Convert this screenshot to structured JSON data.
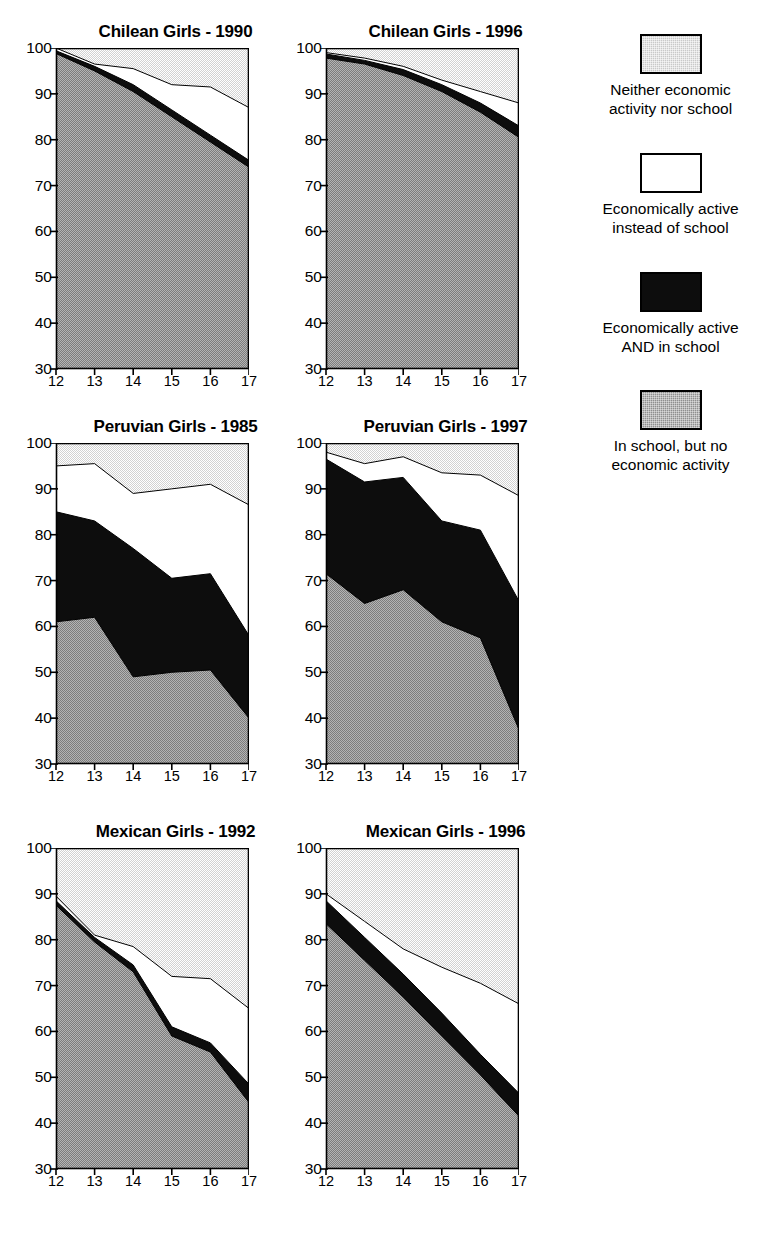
{
  "figure": {
    "x_axis_label": "",
    "y_axis_label": ""
  },
  "legend": {
    "items": [
      {
        "key": "neither",
        "label": "Neither economic\nactivity nor school",
        "color": "#c9c9c9",
        "swatch_class": "sw-neither",
        "icon": "legend-swatch-light-gray"
      },
      {
        "key": "active_only",
        "label": "Economically active\ninstead of school",
        "color": "#ffffff",
        "swatch_class": "sw-active-only",
        "icon": "legend-swatch-white"
      },
      {
        "key": "active_school",
        "label": "Economically active\nAND in school",
        "color": "#0d0d0d",
        "swatch_class": "sw-active-school",
        "icon": "legend-swatch-black"
      },
      {
        "key": "school_only",
        "label": "In school, but no\neconomic activity",
        "color": "#8f8f8f",
        "swatch_class": "sw-school-only",
        "icon": "legend-swatch-dark-gray"
      }
    ]
  },
  "chart_data": [
    {
      "id": "chilean-1990",
      "type": "area",
      "title": "Chilean Girls - 1990",
      "xlabel": "",
      "ylabel": "",
      "x": [
        12,
        13,
        14,
        15,
        16,
        17
      ],
      "xtick_labels": [
        "12",
        "13",
        "14",
        "15",
        "16",
        "17"
      ],
      "ytick_labels": [
        "30",
        "40",
        "50",
        "60",
        "70",
        "80",
        "90",
        "100"
      ],
      "xlim": [
        12,
        17
      ],
      "ylim": [
        30,
        100
      ],
      "grid": false,
      "stacked": true,
      "stack_order_bottom_to_top": [
        "school_only",
        "active_school",
        "active_only",
        "neither"
      ],
      "series": [
        {
          "name": "In school, but no economic activity",
          "key": "school_only",
          "color": "#8f8f8f",
          "cumulative_top": [
            98.8,
            95.0,
            90.5,
            85.0,
            79.5,
            74.0
          ]
        },
        {
          "name": "Economically active AND in school",
          "key": "active_school",
          "color": "#0d0d0d",
          "cumulative_top": [
            99.4,
            96.0,
            92.0,
            86.5,
            81.0,
            75.5
          ]
        },
        {
          "name": "Economically active instead of school",
          "key": "active_only",
          "color": "#ffffff",
          "cumulative_top": [
            100.0,
            96.5,
            95.5,
            92.0,
            91.5,
            87.0
          ]
        },
        {
          "name": "Neither economic activity nor school",
          "key": "neither",
          "color": "#c9c9c9",
          "cumulative_top": [
            100.0,
            100.0,
            100.0,
            100.0,
            100.0,
            100.0
          ]
        }
      ]
    },
    {
      "id": "chilean-1996",
      "type": "area",
      "title": "Chilean Girls - 1996",
      "xlabel": "",
      "ylabel": "",
      "x": [
        12,
        13,
        14,
        15,
        16,
        17
      ],
      "xtick_labels": [
        "12",
        "13",
        "14",
        "15",
        "16",
        "17"
      ],
      "ytick_labels": [
        "30",
        "40",
        "50",
        "60",
        "70",
        "80",
        "90",
        "100"
      ],
      "xlim": [
        12,
        17
      ],
      "ylim": [
        30,
        100
      ],
      "grid": false,
      "stacked": true,
      "stack_order_bottom_to_top": [
        "school_only",
        "active_school",
        "active_only",
        "neither"
      ],
      "series": [
        {
          "name": "In school, but no economic activity",
          "key": "school_only",
          "color": "#8f8f8f",
          "cumulative_top": [
            97.8,
            96.5,
            94.0,
            90.5,
            86.0,
            80.5
          ]
        },
        {
          "name": "Economically active AND in school",
          "key": "active_school",
          "color": "#0d0d0d",
          "cumulative_top": [
            98.7,
            97.3,
            95.3,
            92.0,
            88.0,
            83.0
          ]
        },
        {
          "name": "Economically active instead of school",
          "key": "active_only",
          "color": "#ffffff",
          "cumulative_top": [
            99.0,
            97.8,
            96.0,
            93.0,
            90.5,
            88.0
          ]
        },
        {
          "name": "Neither economic activity nor school",
          "key": "neither",
          "color": "#c9c9c9",
          "cumulative_top": [
            100.0,
            100.0,
            100.0,
            100.0,
            100.0,
            100.0
          ]
        }
      ]
    },
    {
      "id": "peruvian-1985",
      "type": "area",
      "title": "Peruvian Girls - 1985",
      "xlabel": "",
      "ylabel": "",
      "x": [
        12,
        13,
        14,
        15,
        16,
        17
      ],
      "xtick_labels": [
        "12",
        "13",
        "14",
        "15",
        "16",
        "17"
      ],
      "ytick_labels": [
        "30",
        "40",
        "50",
        "60",
        "70",
        "80",
        "90",
        "100"
      ],
      "xlim": [
        12,
        17
      ],
      "ylim": [
        30,
        100
      ],
      "grid": false,
      "stacked": true,
      "stack_order_bottom_to_top": [
        "school_only",
        "active_school",
        "active_only",
        "neither"
      ],
      "series": [
        {
          "name": "In school, but no economic activity",
          "key": "school_only",
          "color": "#8f8f8f",
          "cumulative_top": [
            61.0,
            62.0,
            49.0,
            50.0,
            50.5,
            40.0
          ]
        },
        {
          "name": "Economically active AND in school",
          "key": "active_school",
          "color": "#0d0d0d",
          "cumulative_top": [
            85.0,
            83.0,
            77.0,
            70.5,
            71.5,
            58.0
          ]
        },
        {
          "name": "Economically active instead of school",
          "key": "active_only",
          "color": "#ffffff",
          "cumulative_top": [
            95.0,
            95.5,
            89.0,
            90.0,
            91.0,
            86.5
          ]
        },
        {
          "name": "Neither economic activity nor school",
          "key": "neither",
          "color": "#c9c9c9",
          "cumulative_top": [
            100.0,
            100.0,
            100.0,
            100.0,
            100.0,
            100.0
          ]
        }
      ]
    },
    {
      "id": "peruvian-1997",
      "type": "area",
      "title": "Peruvian Girls - 1997",
      "xlabel": "",
      "ylabel": "",
      "x": [
        12,
        13,
        14,
        15,
        16,
        17
      ],
      "xtick_labels": [
        "12",
        "13",
        "14",
        "15",
        "16",
        "17"
      ],
      "ytick_labels": [
        "30",
        "40",
        "50",
        "60",
        "70",
        "80",
        "90",
        "100"
      ],
      "xlim": [
        12,
        17
      ],
      "ylim": [
        30,
        100
      ],
      "grid": false,
      "stacked": true,
      "stack_order_bottom_to_top": [
        "school_only",
        "active_school",
        "active_only",
        "neither"
      ],
      "series": [
        {
          "name": "In school, but no economic activity",
          "key": "school_only",
          "color": "#8f8f8f",
          "cumulative_top": [
            71.5,
            65.0,
            68.0,
            61.0,
            57.5,
            37.5
          ]
        },
        {
          "name": "Economically active AND in school",
          "key": "active_school",
          "color": "#0d0d0d",
          "cumulative_top": [
            96.5,
            91.5,
            92.5,
            83.0,
            81.0,
            65.5
          ]
        },
        {
          "name": "Economically active instead of school",
          "key": "active_only",
          "color": "#ffffff",
          "cumulative_top": [
            98.0,
            95.5,
            97.0,
            93.5,
            93.0,
            88.5
          ]
        },
        {
          "name": "Neither economic activity nor school",
          "key": "neither",
          "color": "#c9c9c9",
          "cumulative_top": [
            100.0,
            100.0,
            100.0,
            100.0,
            100.0,
            100.0
          ]
        }
      ]
    },
    {
      "id": "mexican-1992",
      "type": "area",
      "title": "Mexican Girls - 1992",
      "xlabel": "",
      "ylabel": "",
      "x": [
        12,
        13,
        14,
        15,
        16,
        17
      ],
      "xtick_labels": [
        "12",
        "13",
        "14",
        "15",
        "16",
        "17"
      ],
      "ytick_labels": [
        "30",
        "40",
        "50",
        "60",
        "70",
        "80",
        "90",
        "100"
      ],
      "xlim": [
        12,
        17
      ],
      "ylim": [
        30,
        100
      ],
      "grid": false,
      "stacked": true,
      "stack_order_bottom_to_top": [
        "school_only",
        "active_school",
        "active_only",
        "neither"
      ],
      "series": [
        {
          "name": "In school, but no economic activity",
          "key": "school_only",
          "color": "#8f8f8f",
          "cumulative_top": [
            87.5,
            79.5,
            73.0,
            59.0,
            55.5,
            44.5
          ]
        },
        {
          "name": "Economically active AND in school",
          "key": "active_school",
          "color": "#0d0d0d",
          "cumulative_top": [
            88.5,
            80.5,
            74.5,
            61.0,
            57.5,
            48.5
          ]
        },
        {
          "name": "Economically active instead of school",
          "key": "active_only",
          "color": "#ffffff",
          "cumulative_top": [
            89.5,
            81.0,
            78.5,
            72.0,
            71.5,
            65.0
          ]
        },
        {
          "name": "Neither economic activity nor school",
          "key": "neither",
          "color": "#c9c9c9",
          "cumulative_top": [
            100.0,
            100.0,
            100.0,
            100.0,
            100.0,
            100.0
          ]
        }
      ]
    },
    {
      "id": "mexican-1996",
      "type": "area",
      "title": "Mexican Girls - 1996",
      "xlabel": "",
      "ylabel": "",
      "x": [
        12,
        13,
        14,
        15,
        16,
        17
      ],
      "xtick_labels": [
        "12",
        "13",
        "14",
        "15",
        "16",
        "17"
      ],
      "ytick_labels": [
        "30",
        "40",
        "50",
        "60",
        "70",
        "80",
        "90",
        "100"
      ],
      "xlim": [
        12,
        17
      ],
      "ylim": [
        30,
        100
      ],
      "grid": false,
      "stacked": true,
      "stack_order_bottom_to_top": [
        "school_only",
        "active_school",
        "active_only",
        "neither"
      ],
      "series": [
        {
          "name": "In school, but no economic activity",
          "key": "school_only",
          "color": "#8f8f8f",
          "cumulative_top": [
            83.5,
            75.5,
            67.5,
            59.0,
            50.5,
            41.5
          ]
        },
        {
          "name": "Economically active AND in school",
          "key": "active_school",
          "color": "#0d0d0d",
          "cumulative_top": [
            88.5,
            80.5,
            72.5,
            64.0,
            55.0,
            46.5
          ]
        },
        {
          "name": "Economically active instead of school",
          "key": "active_only",
          "color": "#ffffff",
          "cumulative_top": [
            90.0,
            84.0,
            78.0,
            74.0,
            70.5,
            66.0
          ]
        },
        {
          "name": "Neither economic activity nor school",
          "key": "neither",
          "color": "#c9c9c9",
          "cumulative_top": [
            100.0,
            100.0,
            100.0,
            100.0,
            100.0,
            100.0
          ]
        }
      ]
    }
  ],
  "layout": {
    "panel_positions": [
      {
        "id": "chilean-1990",
        "left": 16,
        "top": 22
      },
      {
        "id": "chilean-1996",
        "left": 286,
        "top": 22
      },
      {
        "id": "peruvian-1985",
        "left": 16,
        "top": 417
      },
      {
        "id": "peruvian-1997",
        "left": 286,
        "top": 417
      },
      {
        "id": "mexican-1992",
        "left": 16,
        "top": 822
      },
      {
        "id": "mexican-1996",
        "left": 286,
        "top": 822
      }
    ],
    "plot_width": 193,
    "plot_height": 321
  }
}
